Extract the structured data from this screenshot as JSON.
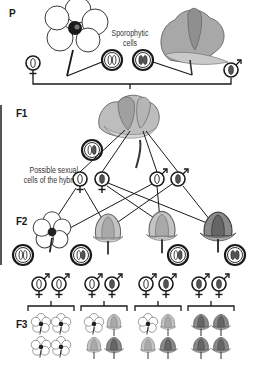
{
  "generations": {
    "p": "P",
    "f1": "F1",
    "f2": "F2",
    "f3": "F3"
  },
  "captions": {
    "sporophytic_line1": "Sporophytic",
    "sporophytic_line2": "cells",
    "hybrid_line1": "Possible sexual",
    "hybrid_line2": "cells of the hybrid"
  },
  "colors": {
    "line": "#1a1a1a",
    "white_flower_fill": "#ffffff",
    "pink_flower_fill": "#bdbdbd",
    "dark_chromosome": "#555555",
    "light_chromosome": "#ffffff"
  },
  "parents": [
    {
      "name": "white-flowered parent",
      "gamete_sex": "female",
      "gamete": "light",
      "sporophytic_cell": [
        "light",
        "light"
      ]
    },
    {
      "name": "dark-flowered parent",
      "gamete_sex": "male",
      "gamete": "dark",
      "sporophytic_cell": [
        "dark",
        "dark"
      ]
    }
  ],
  "f1": {
    "sporophytic_cell": [
      "light",
      "dark"
    ],
    "gametes": [
      {
        "sex": "female",
        "chromosome": "light"
      },
      {
        "sex": "female",
        "chromosome": "dark"
      },
      {
        "sex": "male",
        "chromosome": "light"
      },
      {
        "sex": "male",
        "chromosome": "dark"
      }
    ]
  },
  "f2": [
    {
      "flower": "white",
      "cell": [
        "light",
        "light"
      ],
      "gametes": [
        "light",
        "light"
      ]
    },
    {
      "flower": "pink",
      "cell": [
        "light",
        "dark"
      ],
      "gametes": [
        "light",
        "dark"
      ]
    },
    {
      "flower": "pink-open",
      "cell": [
        "light",
        "dark"
      ],
      "gametes": [
        "light",
        "dark"
      ]
    },
    {
      "flower": "dark",
      "cell": [
        "dark",
        "dark"
      ],
      "gametes": [
        "dark",
        "dark"
      ]
    }
  ],
  "f3": [
    {
      "offspring": [
        "white",
        "white",
        "white",
        "white"
      ]
    },
    {
      "offspring": [
        "white",
        "pink",
        "pink",
        "dark"
      ]
    },
    {
      "offspring": [
        "white",
        "pink",
        "pink",
        "dark"
      ]
    },
    {
      "offspring": [
        "dark",
        "dark",
        "dark",
        "dark"
      ]
    }
  ]
}
